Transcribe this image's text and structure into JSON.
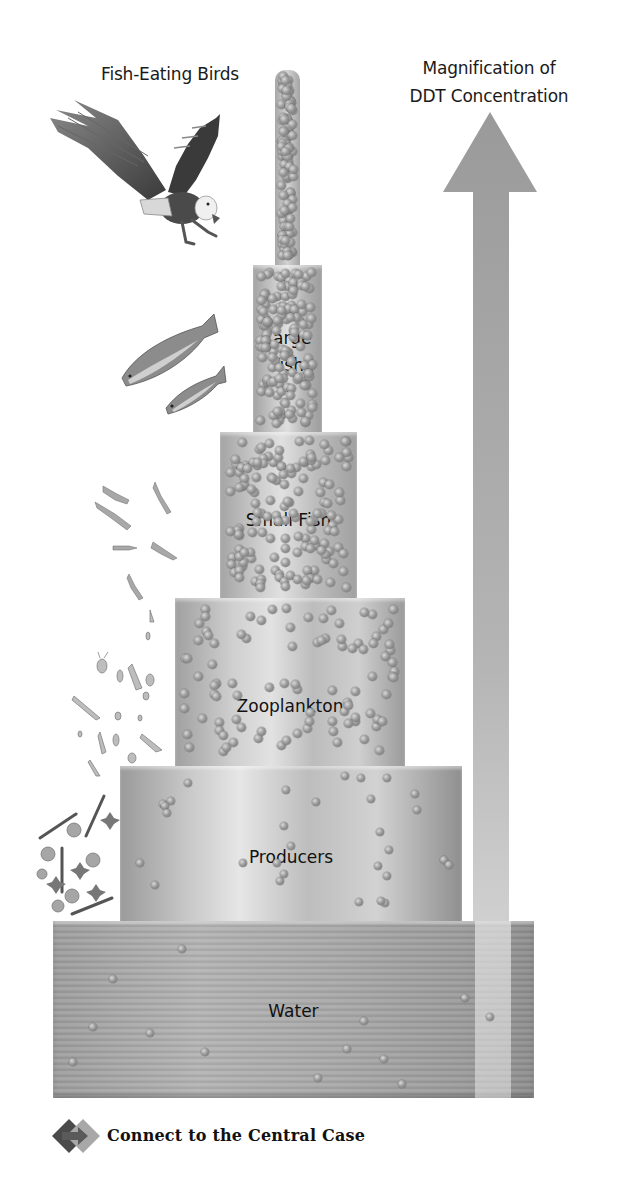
{
  "diagram": {
    "title_left": "Fish-Eating Birds",
    "title_right_line1": "Magnification of",
    "title_right_line2": "DDT Concentration",
    "tiers": [
      {
        "id": "birds",
        "label": "",
        "dot_density": "very high"
      },
      {
        "id": "large-fish",
        "label_line1": "Large",
        "label_line2": "Fish",
        "dot_density": "high"
      },
      {
        "id": "small-fish",
        "label": "Small Fish",
        "dot_density": "medium-high"
      },
      {
        "id": "zooplankton",
        "label": "Zooplankton",
        "dot_density": "medium"
      },
      {
        "id": "producers",
        "label": "Producers",
        "dot_density": "low"
      },
      {
        "id": "water",
        "label": "Water",
        "dot_density": "very low"
      }
    ],
    "arrow": {
      "direction": "up",
      "meaning": "Magnification of DDT Concentration"
    },
    "organisms": [
      "eagle",
      "large-fish",
      "small-fish",
      "zooplankton",
      "phytoplankton"
    ],
    "colors": {
      "tier_gray": "#a8a8a8",
      "arrow_gray": "#9c9c9c",
      "text": "#111111",
      "background": "#ffffff"
    }
  },
  "footer": {
    "link_label": "Connect to the Central Case",
    "icon": "connect-arrow-icon"
  }
}
